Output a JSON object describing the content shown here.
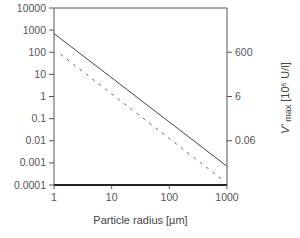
{
  "chart_data": {
    "type": "line",
    "title": "",
    "xlabel": "Particle radius  [µm]",
    "ylabel": "",
    "ylabel_right": "V′ max  [10⁶ U/l]",
    "x_scale": "log",
    "y_scale": "log",
    "xlim": [
      1,
      1000
    ],
    "ylim": [
      0.0001,
      10000
    ],
    "x_ticks": [
      "1",
      "10",
      "100",
      "1000"
    ],
    "y_ticks": [
      "10000",
      "1000",
      "100",
      "10",
      "1",
      "0.1",
      "0.01",
      "0.001",
      "0.0001"
    ],
    "y_right_ticks": [
      {
        "label": "600",
        "at_left_value": 100
      },
      {
        "label": "6",
        "at_left_value": 1
      },
      {
        "label": "0.06",
        "at_left_value": 0.01
      }
    ],
    "grid": false,
    "legend": null,
    "series": [
      {
        "name": "solid",
        "style": "solid",
        "x": [
          1,
          1000
        ],
        "y": [
          700,
          0.0007
        ]
      },
      {
        "name": "dashed",
        "style": "dashed",
        "x": [
          1.3,
          900
        ],
        "y": [
          80,
          0.00015
        ]
      }
    ]
  },
  "labels": {
    "xlabel": "Particle radius  [µm]",
    "ylabel_right_main": "V′",
    "ylabel_right_sub": " max",
    "ylabel_right_unit": "  [10⁶ U/l]"
  }
}
